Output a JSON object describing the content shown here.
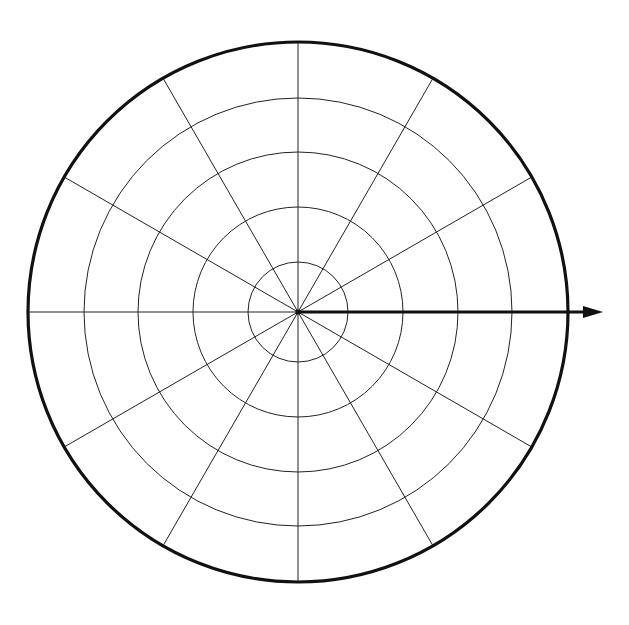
{
  "diagram": {
    "type": "polar-grid",
    "background": "#ffffff",
    "line_color": "#222222",
    "center": [
      298,
      312
    ],
    "outer_radius": 270,
    "ring_radii": [
      50,
      105,
      160,
      214
    ],
    "spoke_count": 12,
    "spoke_angle_step_deg": 30,
    "polar_axis": {
      "direction": "0deg (positive x)",
      "end_x": 603,
      "arrow": true
    }
  }
}
